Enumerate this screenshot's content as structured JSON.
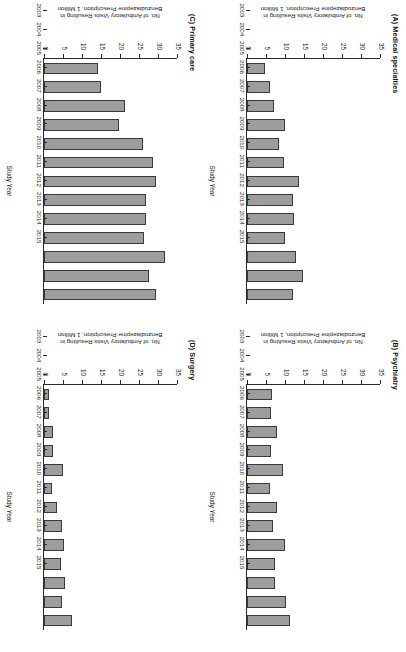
{
  "figure": {
    "rotation_note": "figure rendered rotated 90 degrees",
    "bar_color": "#9d9d9d",
    "bar_edge_color": "#3a3a3a",
    "axis_color": "#2b2b2b"
  },
  "axis": {
    "xlabel": "Study Year",
    "ylabel_line1": "No. of Ambulatory Visits Resulting in",
    "ylabel_line2": "Benzodiazepine Prescription, 1 Million",
    "yticks": [
      0,
      5,
      10,
      15,
      20,
      25,
      30,
      35
    ],
    "ylim": [
      0,
      35
    ],
    "years": [
      "2003",
      "2004",
      "2005",
      "2006",
      "2007",
      "2008",
      "2009",
      "2010",
      "2011",
      "2012",
      "2013",
      "2014",
      "2015"
    ]
  },
  "chart_data": [
    {
      "type": "bar",
      "panel": "A",
      "title": "(A) Medical specialties",
      "categories": [
        "2003",
        "2004",
        "2005",
        "2006",
        "2007",
        "2008",
        "2009",
        "2010",
        "2011",
        "2012",
        "2013",
        "2014",
        "2015"
      ],
      "values": [
        4.8,
        6.0,
        7.0,
        10.0,
        8.3,
        9.7,
        13.6,
        12.2,
        12.4,
        10.0,
        13.0,
        14.8,
        12.2
      ],
      "xlabel": "Study Year",
      "ylabel": "No. of Ambulatory Visits Resulting in Benzodiazepine Prescription, 1 Million",
      "ylim": [
        0,
        35
      ],
      "grid": false,
      "legend": "none"
    },
    {
      "type": "bar",
      "panel": "B",
      "title": "(B) Psychiatry",
      "categories": [
        "2003",
        "2004",
        "2005",
        "2006",
        "2007",
        "2008",
        "2009",
        "2010",
        "2011",
        "2012",
        "2013",
        "2014",
        "2015"
      ],
      "values": [
        6.6,
        6.3,
        8.0,
        6.2,
        9.6,
        6.1,
        8.0,
        6.8,
        10.1,
        7.3,
        7.5,
        10.2,
        11.3
      ],
      "xlabel": "Study Year",
      "ylabel": "No. of Ambulatory Visits Resulting in Benzodiazepine Prescription, 1 Million",
      "ylim": [
        0,
        35
      ],
      "grid": false,
      "legend": "none"
    },
    {
      "type": "bar",
      "panel": "C",
      "title": "(C) Primary care",
      "categories": [
        "2003",
        "2004",
        "2005",
        "2006",
        "2007",
        "2008",
        "2009",
        "2010",
        "2011",
        "2012",
        "2013",
        "2014",
        "2015"
      ],
      "values": [
        14.2,
        15.0,
        21.4,
        19.8,
        26.0,
        28.6,
        29.6,
        26.8,
        26.8,
        26.2,
        31.8,
        27.6,
        29.6
      ],
      "xlabel": "Study Year",
      "ylabel": "No. of Ambulatory Visits Resulting in Benzodiazepine Prescription, 1 Million",
      "ylim": [
        0,
        35
      ],
      "grid": false,
      "legend": "none"
    },
    {
      "type": "bar",
      "panel": "D",
      "title": "(D) Surgery",
      "categories": [
        "2003",
        "2004",
        "2005",
        "2006",
        "2007",
        "2008",
        "2009",
        "2010",
        "2011",
        "2012",
        "2013",
        "2014",
        "2015"
      ],
      "values": [
        1.3,
        1.3,
        2.5,
        2.4,
        4.9,
        2.1,
        3.4,
        4.7,
        5.2,
        4.6,
        5.6,
        4.8,
        7.4
      ],
      "xlabel": "Study Year",
      "ylabel": "No. of Ambulatory Visits Resulting in Benzodiazepine Prescription, 1 Million",
      "ylim": [
        0,
        35
      ],
      "grid": false,
      "legend": "none"
    }
  ]
}
